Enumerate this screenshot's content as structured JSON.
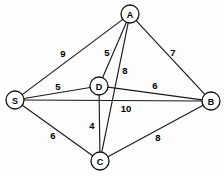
{
  "figure": {
    "type": "weighted-undirected-graph",
    "background_color": "#fdfdfd",
    "stroke_color": "#111111",
    "text_color": "#000000",
    "width": 224,
    "height": 176
  },
  "chart_data": {
    "type": "diagram",
    "title": "",
    "nodes": [
      {
        "id": "A",
        "label": "A",
        "x": 130,
        "y": 14,
        "r": 9
      },
      {
        "id": "S",
        "label": "S",
        "x": 15,
        "y": 100,
        "r": 9
      },
      {
        "id": "B",
        "label": "B",
        "x": 211,
        "y": 101,
        "r": 9
      },
      {
        "id": "C",
        "label": "C",
        "x": 100,
        "y": 161,
        "r": 9
      },
      {
        "id": "D",
        "label": "D",
        "x": 99,
        "y": 86,
        "r": 9
      }
    ],
    "edges": [
      {
        "from": "S",
        "to": "A",
        "weight": "9",
        "label_x": 63,
        "label_y": 53
      },
      {
        "from": "A",
        "to": "D",
        "weight": "5",
        "label_x": 107,
        "label_y": 52
      },
      {
        "from": "A",
        "to": "C",
        "weight": "8",
        "label_x": 125,
        "label_y": 70
      },
      {
        "from": "A",
        "to": "B",
        "weight": "7",
        "label_x": 173,
        "label_y": 52
      },
      {
        "from": "S",
        "to": "D",
        "weight": "5",
        "label_x": 58,
        "label_y": 86
      },
      {
        "from": "D",
        "to": "B",
        "weight": "6",
        "label_x": 155,
        "label_y": 85
      },
      {
        "from": "S",
        "to": "B",
        "weight": "10",
        "label_x": 126,
        "label_y": 108
      },
      {
        "from": "D",
        "to": "C",
        "weight": "4",
        "label_x": 92,
        "label_y": 125
      },
      {
        "from": "S",
        "to": "C",
        "weight": "6",
        "label_x": 53,
        "label_y": 135
      },
      {
        "from": "C",
        "to": "B",
        "weight": "8",
        "label_x": 158,
        "label_y": 137
      }
    ]
  }
}
